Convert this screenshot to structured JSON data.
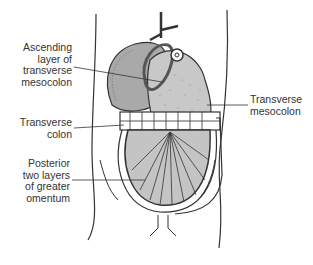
{
  "figure": {
    "colors": {
      "stroke": "#333333",
      "liver_fill": "#a9a9a9",
      "stomach_fill": "#c8c8c8",
      "omentum_fill": "#c4c4c4",
      "background": "#ffffff"
    },
    "labels": {
      "ascending_layer": {
        "lines": [
          "Ascending",
          "layer of",
          "transverse",
          "mesocolon"
        ]
      },
      "transverse_colon": {
        "lines": [
          "Transverse",
          "colon"
        ]
      },
      "posterior_layers": {
        "lines": [
          "Posterior",
          "two layers",
          "of greater",
          "omentum"
        ]
      },
      "transverse_mesocolon": {
        "lines": [
          "Transverse",
          "mesocolon"
        ]
      }
    }
  }
}
